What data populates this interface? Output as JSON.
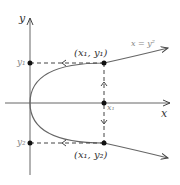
{
  "diagram": {
    "axes": {
      "x_label": "x",
      "y_label": "y"
    },
    "curve": {
      "equation": "x = y²",
      "color": "#555555"
    },
    "points": {
      "upper": "(x₁, y₁)",
      "lower": "(x₁, y₂)"
    },
    "ticks": {
      "y1": "y₁",
      "y2": "y₂",
      "x1": "x₁"
    }
  }
}
